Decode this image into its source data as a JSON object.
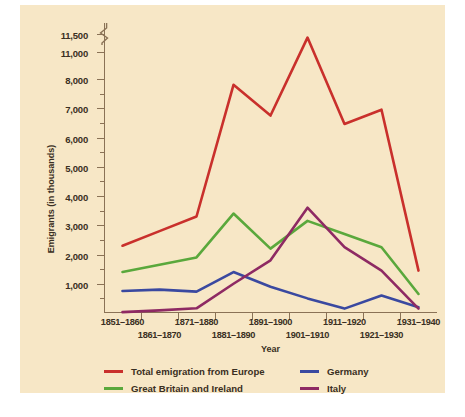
{
  "chart_data": {
    "type": "line",
    "title": "",
    "xlabel": "Year",
    "ylabel": "Emigrants (in thousands)",
    "categories": [
      "1851–1860",
      "1861–1870",
      "1871–1880",
      "1881–1890",
      "1891–1900",
      "1901–1910",
      "1911–1920",
      "1921–1930",
      "1931–1940"
    ],
    "ylim": [
      0,
      11500
    ],
    "y_ticks_major": [
      1000,
      2000,
      3000,
      4000,
      5000,
      6000,
      7000,
      8000,
      11000,
      11500
    ],
    "y_tick_labels": [
      "1,000",
      "2,000",
      "3,000",
      "4,000",
      "5,000",
      "6,000",
      "7,000",
      "8,000",
      "11,000",
      "11,500"
    ],
    "axis_break": {
      "between": [
        8000,
        11000
      ],
      "note": "y-axis broken between 8,000 and 11,000"
    },
    "grid": false,
    "legend_position": "bottom",
    "series": [
      {
        "name": "Total emigration from Europe",
        "color": "#c9302c",
        "values": [
          2300,
          2800,
          3300,
          7800,
          6750,
          11400,
          9000,
          6950,
          1450
        ]
      },
      {
        "name": "Great Britain and Ireland",
        "color": "#5aa83c",
        "values": [
          1400,
          1650,
          1900,
          3400,
          2200,
          3150,
          2700,
          2250,
          650
        ]
      },
      {
        "name": "Germany",
        "color": "#3a49a0",
        "values": [
          750,
          800,
          730,
          1400,
          900,
          500,
          150,
          600,
          200
        ]
      },
      {
        "name": "Italy",
        "color": "#8e2a63",
        "values": [
          30,
          90,
          160,
          1000,
          1800,
          3600,
          2250,
          1450,
          150
        ]
      }
    ]
  },
  "axis": {
    "x_title": "Year",
    "y_title": "Emigrants (in thousands)"
  },
  "legend": {
    "entries": [
      {
        "label": "Total emigration from Europe",
        "color": "#c9302c"
      },
      {
        "label": "Germany",
        "color": "#3a49a0"
      },
      {
        "label": "Great Britain and Ireland",
        "color": "#5aa83c"
      },
      {
        "label": "Italy",
        "color": "#8e2a63"
      }
    ]
  }
}
